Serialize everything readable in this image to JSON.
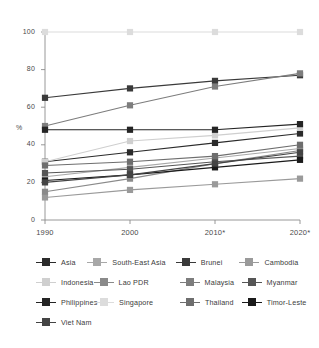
{
  "chart_data": {
    "type": "line",
    "title": "",
    "subtitle": "",
    "xlabel": "",
    "ylabel": "%",
    "x": [
      "1990",
      "2000",
      "2010*",
      "2020*"
    ],
    "categories": [
      "1990",
      "2000",
      "2010*",
      "2020*"
    ],
    "ylim": [
      0,
      100
    ],
    "yticks": [
      0,
      20,
      40,
      60,
      80,
      100
    ],
    "ytick_labels": [
      "0",
      "20",
      "40",
      "60",
      "80",
      "100"
    ],
    "grid": false,
    "legend_position": "bottom",
    "legend_columns": 4,
    "marker": "square",
    "series": [
      {
        "name": "Asia",
        "color": "#2b2b2b",
        "values": [
          31,
          36,
          41,
          46
        ]
      },
      {
        "name": "South-East Asia",
        "color": "#a8a8a8",
        "values": [
          23,
          28,
          33,
          38
        ]
      },
      {
        "name": "Brunei",
        "color": "#3a3a3a",
        "values": [
          65,
          70,
          74,
          77
        ]
      },
      {
        "name": "Cambodia",
        "color": "#9a9a9a",
        "values": [
          12,
          16,
          19,
          22
        ]
      },
      {
        "name": "Indonesia",
        "color": "#cfcfcf",
        "values": [
          31,
          42,
          45,
          49
        ]
      },
      {
        "name": "Lao PDR",
        "color": "#8a8a8a",
        "values": [
          15,
          22,
          30,
          37
        ]
      },
      {
        "name": "Malaysia",
        "color": "#7d7d7d",
        "values": [
          50,
          61,
          71,
          78
        ]
      },
      {
        "name": "Myanmar",
        "color": "#565656",
        "values": [
          25,
          27,
          31,
          34
        ]
      },
      {
        "name": "Philippines",
        "color": "#242424",
        "values": [
          48,
          48,
          48,
          51
        ]
      },
      {
        "name": "Singapore",
        "color": "#dcdcdc",
        "values": [
          100,
          100,
          100,
          100
        ]
      },
      {
        "name": "Thailand",
        "color": "#6e6e6e",
        "values": [
          29,
          31,
          34,
          40
        ]
      },
      {
        "name": "Timor-Leste",
        "color": "#1a1a1a",
        "values": [
          21,
          24,
          28,
          32
        ]
      },
      {
        "name": "Viet Nam",
        "color": "#444444",
        "values": [
          20,
          24,
          30,
          36
        ]
      }
    ]
  },
  "legend": {
    "items": [
      "Asia",
      "South-East Asia",
      "Brunei",
      "Cambodia",
      "Indonesia",
      "Lao PDR",
      "Malaysia",
      "Myanmar",
      "Philippines",
      "Singapore",
      "Thailand",
      "Timor-Leste",
      "Viet Nam"
    ]
  },
  "axis": {
    "y_axis_label": "%",
    "y_tick_labels": [
      "100",
      "80",
      "60",
      "40",
      "20",
      "0"
    ],
    "x_tick_labels": [
      "1990",
      "2000",
      "2010*",
      "2020*"
    ]
  },
  "colors": {
    "axis": "#8c8c8c",
    "text": "#4a4a4a",
    "background": "#ffffff"
  }
}
